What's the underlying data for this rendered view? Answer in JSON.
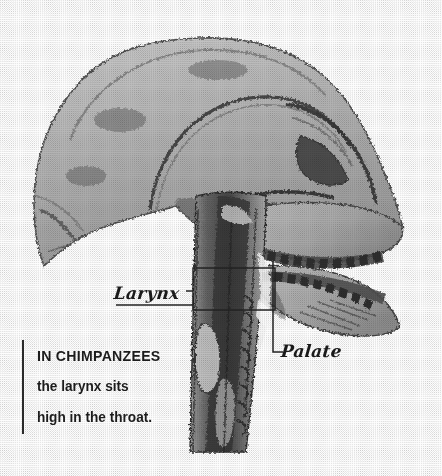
{
  "figure": {
    "background_color": "#fdfdfd",
    "ink_color": "#1c1c1c"
  },
  "annotations": {
    "larynx": {
      "label": "Larynx",
      "icon": "callout-box-icon"
    },
    "palate": {
      "label": "Palate",
      "icon": "leader-line-icon"
    }
  },
  "caption": {
    "line1": "IN CHIMPANZEES",
    "line2": "the larynx sits",
    "line3": "high in the throat."
  }
}
